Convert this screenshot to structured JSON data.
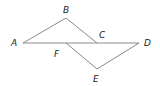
{
  "diagram": {
    "type": "geometry",
    "stroke_color": "#8a8a8a",
    "label_color": "#222222",
    "points": {
      "A": {
        "label": "A",
        "x": 23,
        "y": 43
      },
      "B": {
        "label": "B",
        "x": 66,
        "y": 18
      },
      "C": {
        "label": "C",
        "x": 97,
        "y": 43
      },
      "D": {
        "label": "D",
        "x": 139,
        "y": 43
      },
      "E": {
        "label": "E",
        "x": 97,
        "y": 69
      },
      "F": {
        "label": "F",
        "x": 66,
        "y": 43
      }
    },
    "segments": [
      "AB",
      "BC",
      "AD",
      "FE",
      "ED"
    ]
  }
}
